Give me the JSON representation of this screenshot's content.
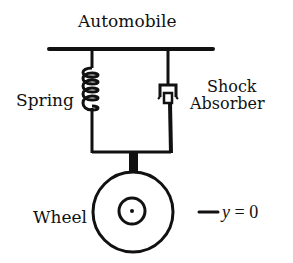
{
  "diagram": {
    "title": "Automobile",
    "labels": {
      "spring": "Spring",
      "shock_line1": "Shock",
      "shock_line2": "Absorber",
      "wheel": "Wheel",
      "equation_var": "y",
      "equation_rest": " = 0"
    },
    "components": [
      "automobile-body-bar",
      "spring",
      "shock-absorber",
      "connector-bar",
      "axle-stem",
      "wheel",
      "wheel-hub",
      "reference-line"
    ],
    "colors": {
      "stroke": "#111111",
      "background": "#ffffff"
    }
  }
}
